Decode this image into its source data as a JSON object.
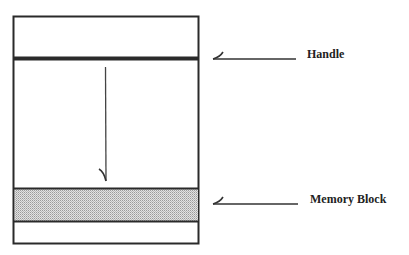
{
  "diagram": {
    "labels": {
      "handle": "Handle",
      "memory_block": "Memory Block"
    },
    "colors": {
      "stroke": "#2a2a2a",
      "block_fill": "#cfcfcf",
      "background": "#ffffff"
    }
  }
}
